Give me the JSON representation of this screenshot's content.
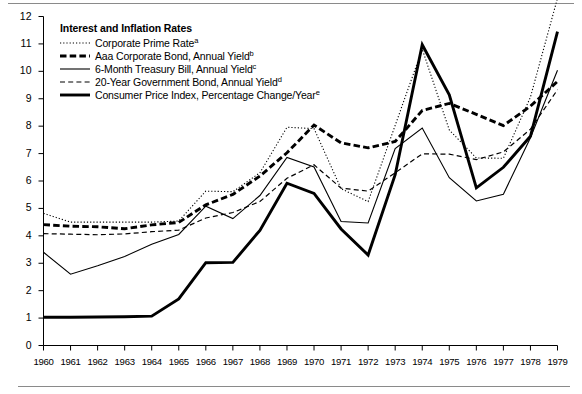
{
  "figure": {
    "title": "Interest and Inflation Rates",
    "has_top_rule": true,
    "has_bottom_rule": true
  },
  "chart_data": {
    "type": "line",
    "title": "Interest and Inflation Rates",
    "xlabel": "",
    "ylabel": "",
    "xlim": [
      1960,
      1979
    ],
    "ylim": [
      0,
      12
    ],
    "grid": false,
    "legend_position": "top-left",
    "x": [
      1960,
      1961,
      1962,
      1963,
      1964,
      1965,
      1966,
      1967,
      1968,
      1969,
      1970,
      1971,
      1972,
      1973,
      1974,
      1975,
      1976,
      1977,
      1978,
      1979
    ],
    "xticklabels": [
      "1960",
      "1961",
      "1962",
      "1963",
      "1964",
      "1965",
      "1966",
      "1967",
      "1968",
      "1969",
      "1970",
      "1971",
      "1972",
      "1973",
      "1974",
      "1975",
      "1976",
      "1977",
      "1978",
      "1979"
    ],
    "yticklabels": [
      "0",
      "1",
      "2",
      "3",
      "4",
      "5",
      "6",
      "7",
      "8",
      "9",
      "10",
      "11",
      "12"
    ],
    "series": [
      {
        "name": "Corporate Prime Rate",
        "footnote": "a",
        "style": "dotted",
        "width": "thin",
        "color": "#000000",
        "values": [
          4.82,
          4.5,
          4.5,
          4.5,
          4.5,
          4.54,
          5.63,
          5.61,
          6.3,
          7.96,
          7.91,
          5.72,
          5.25,
          8.03,
          10.81,
          7.86,
          6.84,
          6.83,
          9.06,
          12.67
        ]
      },
      {
        "name": "Aaa Corporate Bond, Annual Yield",
        "footnote": "b",
        "style": "dashed",
        "width": "thick",
        "color": "#000000",
        "values": [
          4.41,
          4.35,
          4.33,
          4.26,
          4.4,
          4.49,
          5.13,
          5.51,
          6.18,
          7.03,
          8.04,
          7.39,
          7.21,
          7.44,
          8.57,
          8.83,
          8.43,
          8.02,
          8.73,
          9.63
        ]
      },
      {
        "name": "6-Month Treasury Bill, Annual Yield",
        "footnote": "c",
        "style": "solid",
        "width": "thin",
        "color": "#000000",
        "values": [
          3.4,
          2.6,
          2.91,
          3.25,
          3.69,
          4.05,
          5.08,
          4.63,
          5.47,
          6.86,
          6.51,
          4.52,
          4.47,
          7.18,
          7.93,
          6.12,
          5.27,
          5.52,
          7.58,
          10.04
        ]
      },
      {
        "name": "20-Year Government Bond, Annual Yield",
        "footnote": "d",
        "style": "dashed",
        "width": "thin",
        "color": "#000000",
        "values": [
          4.08,
          4.06,
          4.04,
          4.07,
          4.15,
          4.21,
          4.65,
          4.85,
          5.25,
          6.1,
          6.59,
          5.74,
          5.63,
          6.3,
          6.99,
          6.98,
          6.78,
          7.06,
          7.89,
          9.33
        ]
      },
      {
        "name": "Consumer Price Index, Percentage Change/Year",
        "footnote": "e",
        "style": "solid",
        "width": "thick",
        "color": "#000000",
        "values": [
          1.03,
          1.03,
          1.04,
          1.05,
          1.07,
          1.7,
          3.02,
          3.03,
          4.2,
          5.92,
          5.55,
          4.25,
          3.3,
          6.23,
          10.97,
          9.14,
          5.75,
          6.5,
          7.63,
          11.45
        ]
      }
    ]
  }
}
